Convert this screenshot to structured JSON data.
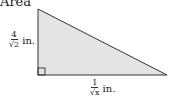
{
  "title": "Area",
  "triangle": {
    "fill": "#e4e4e4",
    "stroke": "#333333",
    "right_angle_marker": true
  },
  "labels": {
    "height": {
      "numerator": "4",
      "denominator": "√2",
      "unit": "in."
    },
    "base": {
      "numerator": "1",
      "denominator": "√x",
      "unit": "in."
    }
  }
}
